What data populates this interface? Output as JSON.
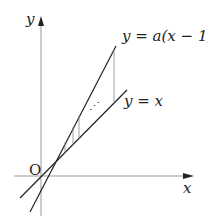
{
  "diagram": {
    "y_axis_label": "y",
    "x_axis_label": "x",
    "origin_label": "O",
    "line1_label": "y = a(x − 1)",
    "line2_label": "y = x",
    "dots_label": "⋰",
    "colors": {
      "line": "#222222",
      "axis": "#999999",
      "step": "#888888"
    }
  }
}
